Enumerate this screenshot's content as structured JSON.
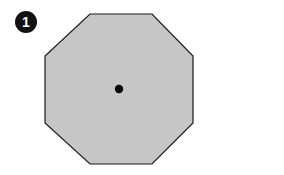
{
  "figure": {
    "background_color": "#ffffff",
    "width": 284,
    "height": 175,
    "badge": {
      "label": "1",
      "shape": "circle",
      "fill_color": "#111111",
      "text_color": "#ffffff",
      "center_x": 26,
      "center_y": 22,
      "radius": 11
    },
    "shapes": [
      {
        "name": "octagon",
        "type": "regular-polygon",
        "sides": 8,
        "fill_color": "#c6c6c6",
        "stroke_color": "#1a1a1a",
        "stroke_width": 1.2,
        "bounding_box": {
          "x": 45,
          "y": 14,
          "width": 148,
          "height": 150
        },
        "vertices": [
          [
            90,
            14
          ],
          [
            152,
            14
          ],
          [
            193,
            56
          ],
          [
            193,
            123
          ],
          [
            152,
            164
          ],
          [
            90,
            164
          ],
          [
            45,
            123
          ],
          [
            45,
            56
          ]
        ]
      },
      {
        "name": "center-point",
        "type": "circle",
        "fill_color": "#000000",
        "center_x": 119,
        "center_y": 89,
        "radius": 4.2
      }
    ]
  }
}
